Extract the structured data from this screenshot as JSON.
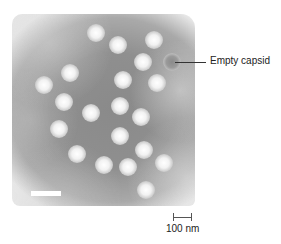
{
  "figure": {
    "type": "negative-stain electron micrograph",
    "particles": [
      {
        "x": 96,
        "y": 33
      },
      {
        "x": 118,
        "y": 45
      },
      {
        "x": 154,
        "y": 40
      },
      {
        "x": 143,
        "y": 62
      },
      {
        "x": 70,
        "y": 73
      },
      {
        "x": 44,
        "y": 85
      },
      {
        "x": 123,
        "y": 80
      },
      {
        "x": 157,
        "y": 83
      },
      {
        "x": 64,
        "y": 102
      },
      {
        "x": 91,
        "y": 113
      },
      {
        "x": 120,
        "y": 106
      },
      {
        "x": 141,
        "y": 117
      },
      {
        "x": 59,
        "y": 129
      },
      {
        "x": 120,
        "y": 136
      },
      {
        "x": 144,
        "y": 150
      },
      {
        "x": 77,
        "y": 154
      },
      {
        "x": 104,
        "y": 165
      },
      {
        "x": 128,
        "y": 167
      },
      {
        "x": 164,
        "y": 163
      },
      {
        "x": 146,
        "y": 190
      }
    ],
    "empty_capsid": {
      "x": 172,
      "y": 62
    }
  },
  "annotations": {
    "empty_capsid_label": "Empty capsid"
  },
  "scale_bar": {
    "label": "100 nm"
  }
}
